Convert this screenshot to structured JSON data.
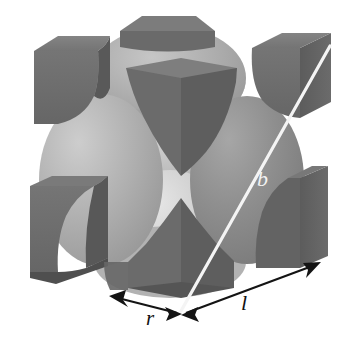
{
  "figure": {
    "background_color": "#ffffff",
    "width": 341,
    "height": 339
  },
  "labels": {
    "r": "r",
    "l": "l",
    "b": "b"
  },
  "colors": {
    "wedge_front": "#6f6f6f",
    "wedge_side": "#5f5f5f",
    "wedge_top": "#7d7d7d",
    "sphere_light": "#b4b4b4",
    "sphere_mid": "#9c9c9c",
    "sphere_dark": "#8a8a8a",
    "sphere_highlight": "#cfcfcf",
    "diagonal_line": "#f2f2f2",
    "arrow": "#141414",
    "background": "#ffffff"
  },
  "annotations": {
    "diagonal_start": [
      330,
      46
    ],
    "diagonal_end": [
      181,
      311
    ],
    "r_arrow_start": [
      113,
      296
    ],
    "r_arrow_end": [
      179,
      313
    ],
    "l_arrow_start": [
      183,
      314
    ],
    "l_arrow_end": [
      318,
      264
    ]
  },
  "elements": {
    "corner_wedge_count": 8,
    "face_sphere_count": 6,
    "diagonal_label": "b",
    "edge_label_short": "r",
    "edge_label_long": "l"
  }
}
